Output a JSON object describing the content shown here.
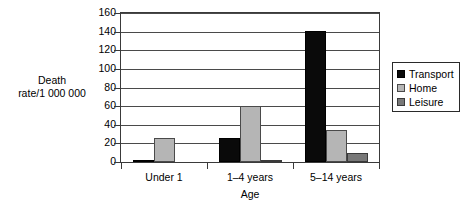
{
  "chart_data": {
    "type": "bar",
    "title": "",
    "subtitle": "",
    "xlabel": "Age",
    "ylabel": "Death\nrate/1 000 000",
    "ylabel_lines": [
      "Death",
      "rate/1 000 000"
    ],
    "categories": [
      "Under 1",
      "1–4 years",
      "5–14 years"
    ],
    "series": [
      {
        "name": "Transport",
        "color": "#0a0a0a",
        "values": [
          2,
          26,
          141
        ]
      },
      {
        "name": "Home",
        "color": "#b5b5b5",
        "values": [
          26,
          60,
          34
        ]
      },
      {
        "name": "Leisure",
        "color": "#787878",
        "values": [
          0,
          1,
          10
        ]
      }
    ],
    "ylim": [
      0,
      160
    ],
    "yticks": [
      0,
      20,
      40,
      60,
      80,
      100,
      120,
      140,
      160
    ],
    "ytick_labels": [
      "0",
      "20",
      "40",
      "60",
      "80",
      "100",
      "120",
      "140",
      "160"
    ],
    "grid": true,
    "grid_axis": "y",
    "legend_position": "right",
    "legend_entries": [
      "Transport",
      "Home",
      "Leisure"
    ],
    "grouped": true,
    "background": "#ffffff",
    "axis_color": "#3a3a3a"
  }
}
